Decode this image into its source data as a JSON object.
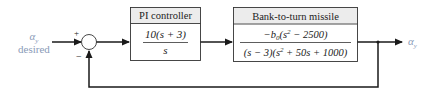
{
  "diagram": {
    "type": "block-diagram",
    "input": {
      "symbol": "α",
      "subscript": "y",
      "label": "desired"
    },
    "summing_junction": {
      "plus_sign": "+",
      "minus_sign": "−"
    },
    "blocks": [
      {
        "title": "PI controller",
        "numerator": "10(s + 3)",
        "denominator": "s"
      },
      {
        "title": "Bank-to-turn missile",
        "numerator_prefix": "−b",
        "numerator_sub": "0",
        "numerator_mid": "(s",
        "numerator_sup": "2",
        "numerator_suffix": " − 2500)",
        "denominator_prefix": "(s − 3)(s",
        "denominator_sup": "2",
        "denominator_suffix": " + 50s + 1000)"
      }
    ],
    "output": {
      "symbol": "α",
      "subscript": "y"
    },
    "feedback": "unity negative feedback",
    "colors": {
      "line": "#1a1a1a",
      "header_fill": "#ececec",
      "label_blue": "#8a9bb8"
    }
  }
}
